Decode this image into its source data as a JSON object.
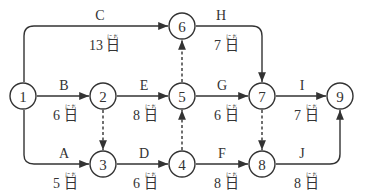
{
  "diagram": {
    "type": "arrow-network",
    "unit": "日",
    "unit_reading": "にち",
    "nodes": [
      {
        "id": "1",
        "label": "1"
      },
      {
        "id": "2",
        "label": "2"
      },
      {
        "id": "3",
        "label": "3"
      },
      {
        "id": "4",
        "label": "4"
      },
      {
        "id": "5",
        "label": "5"
      },
      {
        "id": "6",
        "label": "6"
      },
      {
        "id": "7",
        "label": "7"
      },
      {
        "id": "8",
        "label": "8"
      },
      {
        "id": "9",
        "label": "9"
      }
    ],
    "activities": [
      {
        "name": "A",
        "from": "1",
        "to": "3",
        "duration": "5"
      },
      {
        "name": "B",
        "from": "1",
        "to": "2",
        "duration": "6"
      },
      {
        "name": "C",
        "from": "1",
        "to": "6",
        "duration": "13"
      },
      {
        "name": "D",
        "from": "3",
        "to": "4",
        "duration": "6"
      },
      {
        "name": "E",
        "from": "2",
        "to": "5",
        "duration": "8"
      },
      {
        "name": "F",
        "from": "4",
        "to": "8",
        "duration": "8"
      },
      {
        "name": "G",
        "from": "5",
        "to": "7",
        "duration": "6"
      },
      {
        "name": "H",
        "from": "6",
        "to": "7",
        "duration": "7"
      },
      {
        "name": "I",
        "from": "7",
        "to": "9",
        "duration": "7"
      },
      {
        "name": "J",
        "from": "8",
        "to": "9",
        "duration": "8"
      }
    ],
    "dummies": [
      {
        "from": "2",
        "to": "3"
      },
      {
        "from": "4",
        "to": "5"
      },
      {
        "from": "5",
        "to": "6"
      },
      {
        "from": "7",
        "to": "8"
      }
    ]
  }
}
